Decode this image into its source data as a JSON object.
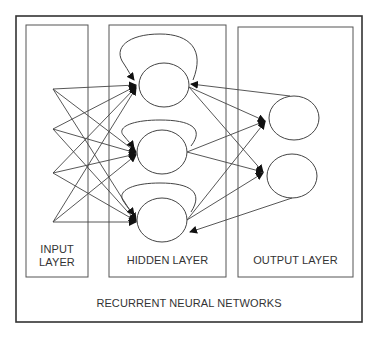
{
  "diagram": {
    "title": "RECURRENT NEURAL NETWORKS",
    "layers": {
      "input": {
        "label_line1": "INPUT",
        "label_line2": "LAYER",
        "points": 4
      },
      "hidden": {
        "label": "HIDDEN LAYER",
        "nodes": 3,
        "self_loops": 3
      },
      "output": {
        "label": "OUTPUT LAYER",
        "nodes": 2
      }
    },
    "colors": {
      "stroke": "#444444",
      "text": "#333333",
      "background": "#ffffff"
    }
  }
}
